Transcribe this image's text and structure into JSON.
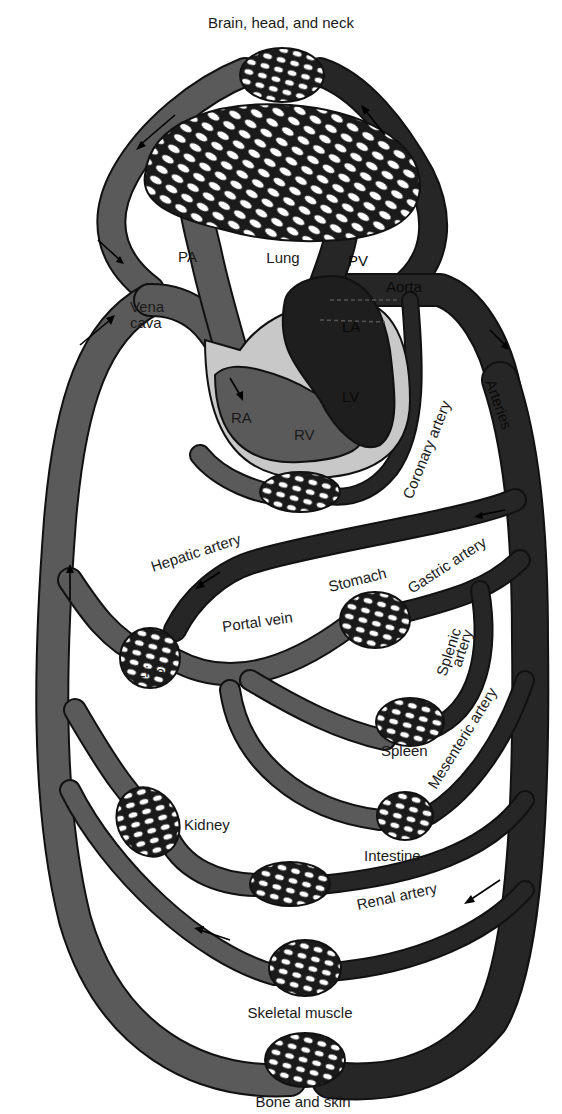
{
  "diagram": {
    "type": "circulatory-system-schematic",
    "colors": {
      "venous_blood": "#5a5a5a",
      "arterial_blood": "#262626",
      "heart_wall": "#c8c8c8",
      "outline": "#111111",
      "background": "#ffffff"
    },
    "labels": {
      "brain": "Brain, head, and neck",
      "lung": "Lung",
      "pa": "PA",
      "pv": "PV",
      "aorta": "Aorta",
      "vena_cava_1": "Vena",
      "vena_cava_2": "cava",
      "la": "LA",
      "lv": "LV",
      "ra": "RA",
      "rv": "RV",
      "coronary_artery": "Coronary artery",
      "arteries": "Arteries",
      "hepatic_artery": "Hepatic artery",
      "stomach": "Stomach",
      "gastric_artery": "Gastric artery",
      "portal_vein": "Portal vein",
      "liver": "Liver",
      "splenic_artery_1": "Splenic",
      "splenic_artery_2": "artery",
      "spleen": "Spleen",
      "mesenteric_artery": "Mesenteric artery",
      "kidney": "Kidney",
      "intestine": "Intestine",
      "renal_artery": "Renal artery",
      "skeletal_muscle": "Skeletal muscle",
      "bone_and_skin": "Bone and skin"
    },
    "organs": [
      "Brain, head, and neck",
      "Lung",
      "Heart (coronary)",
      "Liver",
      "Stomach",
      "Spleen",
      "Intestine",
      "Kidney",
      "Skeletal muscle",
      "Bone and skin"
    ]
  }
}
